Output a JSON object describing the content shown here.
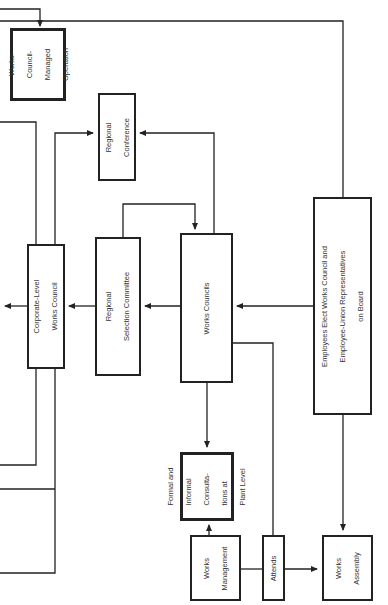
{
  "diagram": {
    "orientation": "rotated-90-ccw",
    "nodes": {
      "works_council_managed_operation": {
        "lines": [
          "Works-",
          "Council-",
          "Managed",
          "Operation"
        ]
      },
      "regional_conference": {
        "lines": [
          "Regional",
          "Conference"
        ]
      },
      "regional_selection_committee": {
        "lines": [
          "Regional",
          "Selection Committee"
        ]
      },
      "corporate_level_works_council": {
        "lines": [
          "Corporate-Level",
          "Works Council"
        ]
      },
      "works_councils": {
        "lines": [
          "Works Councils"
        ]
      },
      "employees_elect": {
        "lines": [
          "Employees Elect Works Council and",
          "Employee-Union Representatives",
          "on Board"
        ]
      },
      "formal_informal_consultations": {
        "lines": [
          "Formal and",
          "Informal",
          "Consulta-",
          "tions at",
          "Plant Level"
        ]
      },
      "works_management": {
        "lines": [
          "Works",
          "Management"
        ]
      },
      "attends": {
        "lines": [
          "Attends"
        ]
      },
      "works_assembly": {
        "lines": [
          "Works",
          "Assembly"
        ]
      }
    },
    "edges": [
      {
        "from": "employees_elect",
        "to": "works_council_managed_operation"
      },
      {
        "from": "employees_elect",
        "to": "works_councils"
      },
      {
        "from": "employees_elect",
        "to": "works_assembly"
      },
      {
        "from": "works_councils",
        "to": "regional_selection_committee"
      },
      {
        "from": "works_councils",
        "to": "regional_conference"
      },
      {
        "from": "works_councils",
        "to": "formal_informal_consultations"
      },
      {
        "from": "works_councils",
        "to": "attends"
      },
      {
        "from": "regional_selection_committee",
        "to": "works_councils"
      },
      {
        "from": "regional_selection_committee",
        "to": "corporate_level_works_council"
      },
      {
        "from": "corporate_level_works_council",
        "to": "regional_conference"
      },
      {
        "from": "corporate_level_works_council",
        "to": "off-page-left"
      },
      {
        "from": "works_management",
        "to": "formal_informal_consultations"
      },
      {
        "from": "works_management",
        "to": "attends"
      },
      {
        "from": "attends",
        "to": "works_assembly"
      }
    ],
    "colors": {
      "line": "#222222",
      "text": "#333333",
      "background": "#ffffff"
    }
  }
}
